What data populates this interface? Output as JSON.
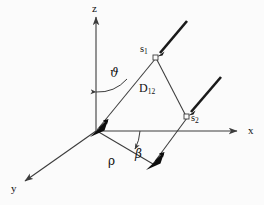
{
  "figure": {
    "background_color": "#fbfbfb",
    "stroke_color": "#3c3c3c",
    "bold_stroke_color": "#111111",
    "label_color": "#111111",
    "width": 264,
    "height": 205
  },
  "axes": [
    {
      "name": "z-axis",
      "label": "z",
      "direction": "up"
    },
    {
      "name": "x-axis",
      "label": "x",
      "direction": "right"
    },
    {
      "name": "y-axis",
      "label": "y",
      "direction": "down-left"
    }
  ],
  "labels": {
    "z": "z",
    "x": "x",
    "y": "y",
    "theta": "ϑ",
    "beta": "β",
    "rho": "ρ",
    "s1": "s",
    "s1_sub": "1",
    "s2": "s",
    "s2_sub": "2",
    "d12": "D",
    "d12_sub": "12"
  },
  "points": {
    "origin": {
      "name": "origin",
      "x": 96,
      "y": 131
    },
    "s1": {
      "name": "point-s1",
      "x": 156,
      "y": 58
    },
    "s2": {
      "name": "point-s2",
      "x": 186,
      "y": 117
    },
    "rho_tip": {
      "name": "rho-vector-tip",
      "x": 152,
      "y": 163
    }
  },
  "angles": [
    {
      "name": "theta",
      "symbol": "ϑ",
      "between": [
        "z-axis",
        "origin-to-s1"
      ]
    },
    {
      "name": "beta",
      "symbol": "β",
      "between": [
        "x-axis",
        "rho-vector"
      ]
    }
  ],
  "segments": [
    {
      "name": "origin-to-s1",
      "from": "origin",
      "to": "s1"
    },
    {
      "name": "d12-segment",
      "from": "s1",
      "to": "s2",
      "label": "D12"
    },
    {
      "name": "s2-to-rho-tip",
      "from": "s2",
      "to": "rho_tip"
    },
    {
      "name": "rho-vector",
      "from": "origin",
      "to": "rho_tip",
      "label": "ρ"
    }
  ],
  "bold_arrows": [
    {
      "name": "spin-arrow-origin",
      "at": "origin",
      "direction": "up-right"
    },
    {
      "name": "spin-arrow-rho-tip",
      "at": "rho_tip",
      "direction": "up-right"
    }
  ],
  "thick_rays": [
    {
      "name": "ray-from-s1",
      "from": "s1",
      "direction": "up-right"
    },
    {
      "name": "ray-from-s2",
      "from": "s2",
      "direction": "up-right"
    }
  ]
}
